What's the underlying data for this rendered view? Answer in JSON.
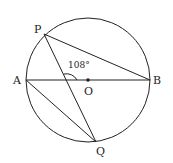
{
  "diagram": {
    "type": "circle-geometry",
    "circle": {
      "center": "O",
      "cx": 88,
      "cy": 80,
      "r": 62
    },
    "points": {
      "P": {
        "label": "P",
        "x": 44,
        "y": 34
      },
      "A": {
        "label": "A",
        "x": 26,
        "y": 80
      },
      "B": {
        "label": "B",
        "x": 150,
        "y": 80
      },
      "O": {
        "label": "O",
        "x": 88,
        "y": 80
      },
      "Q": {
        "label": "Q",
        "x": 96,
        "y": 142
      }
    },
    "segments": [
      "AB",
      "PB",
      "PQ",
      "AQ"
    ],
    "angle": {
      "label": "108°",
      "vertex": "intersection of PQ and AB"
    },
    "colors": {
      "stroke": "#222222",
      "background": "#ffffff"
    }
  }
}
